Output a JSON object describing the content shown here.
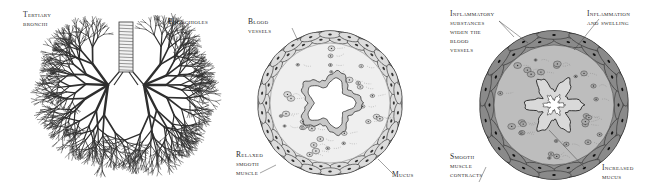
{
  "figure": {
    "panels": [
      {
        "id": "lungs",
        "description": "Bronchial tree of the lungs",
        "labels": {
          "tertiary_bronchi": "Tertiary\nbronchi",
          "bronchioles": "Bronchioles"
        }
      },
      {
        "id": "normal-airway",
        "description": "Cross-section of a normal airway",
        "labels": {
          "blood_vessels": "Blood\nvessels",
          "relaxed_smooth_muscle": "Relaxed\nsmooth\nmuscle",
          "mucus": "Mucus"
        }
      },
      {
        "id": "inflamed-airway",
        "description": "Cross-section of an inflamed airway during an asthma attack",
        "labels": {
          "inflammatory_substances": "Inflammatory\nsubstances\nwiden the\nblood\nvessels",
          "inflammation_swelling": "Inflammation\nand swelling",
          "smooth_muscle_contracts": "Smooth\nmuscle\ncontracts",
          "increased_mucus": "Increased\nmucus"
        }
      }
    ],
    "colors": {
      "ink": "#2a2a2a",
      "tissue_light": "#e6e6e6",
      "tissue_dark": "#9a9a9a",
      "background": "#ffffff"
    }
  }
}
